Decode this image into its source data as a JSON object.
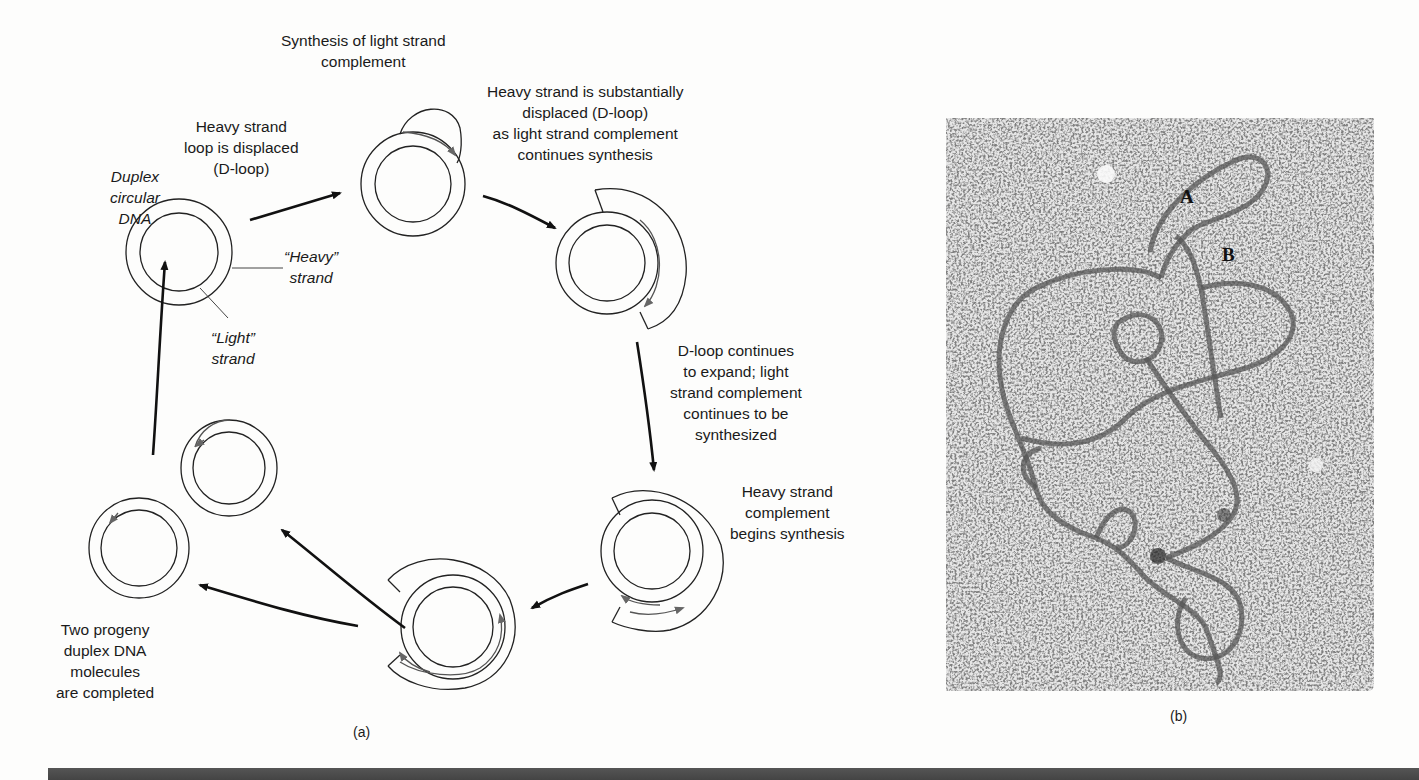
{
  "panel_a": {
    "caption": "(a)",
    "steps": [
      {
        "id": "duplex",
        "label_lines": [
          "Duplex",
          "circular",
          "DNA"
        ],
        "italic": true
      },
      {
        "id": "heavy-strand-label",
        "label_lines": [
          "“Heavy”",
          "strand"
        ],
        "italic": true
      },
      {
        "id": "light-strand-label",
        "label_lines": [
          "“Light”",
          "strand"
        ],
        "italic": true
      },
      {
        "id": "dloop-displaced",
        "label_lines": [
          "Heavy strand",
          "loop is displaced",
          "(D-loop)"
        ]
      },
      {
        "id": "light-synthesis",
        "label_lines": [
          "Synthesis of light strand",
          "complement"
        ]
      },
      {
        "id": "substantially-displaced",
        "label_lines": [
          "Heavy strand is substantially",
          "displaced (D-loop)",
          "as light strand complement",
          "continues synthesis"
        ]
      },
      {
        "id": "dloop-expands",
        "label_lines": [
          "D-loop continues",
          "to expand; light",
          "strand complement",
          "continues to be",
          "synthesized"
        ]
      },
      {
        "id": "heavy-complement",
        "label_lines": [
          "Heavy strand",
          "complement",
          "begins synthesis"
        ]
      },
      {
        "id": "progeny",
        "label_lines": [
          "Two progeny",
          "duplex DNA",
          "molecules",
          "are completed"
        ]
      }
    ]
  },
  "panel_b": {
    "caption": "(b)",
    "markers": [
      "A",
      "B"
    ]
  },
  "colors": {
    "ink": "#1a1a1a",
    "arrowhead_gray": "#666666",
    "micrograph_bg": "#d8d8d8",
    "rule": "#4a4a4a"
  }
}
